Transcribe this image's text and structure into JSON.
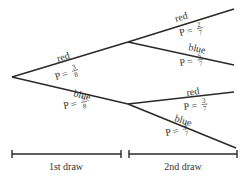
{
  "diagram": {
    "type": "probability-tree",
    "first_draw": {
      "branches": [
        {
          "outcome": "red",
          "p_label": "P =",
          "numerator": "3",
          "denominator": "8"
        },
        {
          "outcome": "blue",
          "p_label": "P =",
          "numerator": "5",
          "denominator": "8"
        }
      ]
    },
    "second_draw": {
      "after_red": [
        {
          "outcome": "red",
          "p_label": "P =",
          "numerator": "2",
          "denominator": "7"
        },
        {
          "outcome": "blue",
          "p_label": "P =",
          "numerator": "5",
          "denominator": "7"
        }
      ],
      "after_blue": [
        {
          "outcome": "red",
          "p_label": "P =",
          "numerator": "3",
          "denominator": "7"
        },
        {
          "outcome": "blue",
          "p_label": "P =",
          "numerator": "4",
          "denominator": "7"
        }
      ]
    },
    "axis": {
      "first_label": "1st draw",
      "second_label": "2nd draw"
    },
    "colors": {
      "line": "#2a2a2a",
      "text": "#333333",
      "background": "#ffffff"
    }
  }
}
